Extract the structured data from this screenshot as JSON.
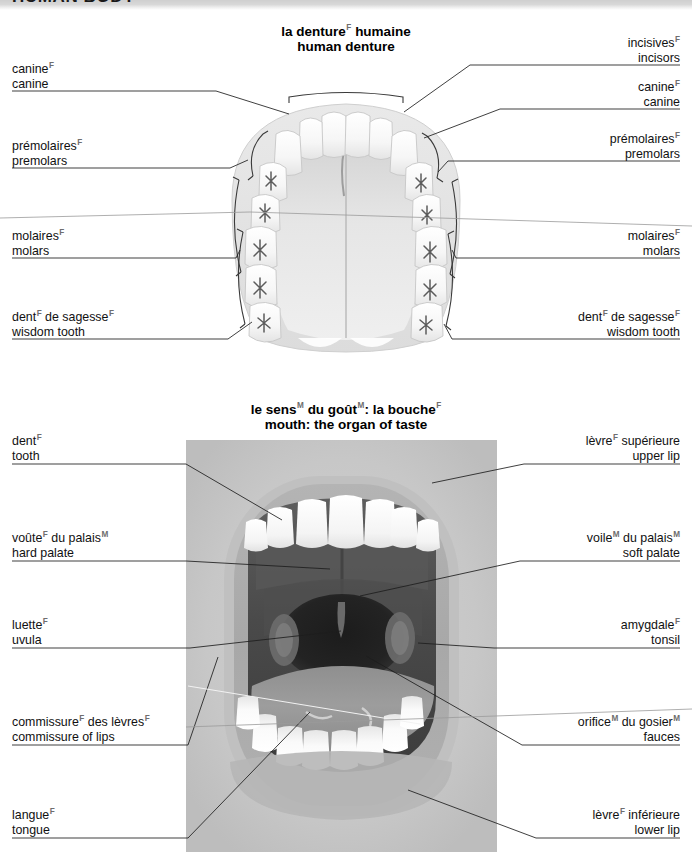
{
  "header": {
    "title": "HUMAN BODY"
  },
  "sections": [
    {
      "id": "denture",
      "title_fr": "la denture",
      "title_fr_sup": "F",
      "title_fr_tail": " humaine",
      "title_en": "human denture",
      "labels_left": [
        {
          "fr": "canine",
          "fr_sup": "F",
          "en": "canine"
        },
        {
          "fr": "prémolaires",
          "fr_sup": "F",
          "en": "premolars"
        },
        {
          "fr": "molaires",
          "fr_sup": "F",
          "en": "molars"
        },
        {
          "fr": "dent",
          "fr_sup": "F",
          "fr_tail": " de sagesse",
          "fr_sup2": "F",
          "en": "wisdom tooth"
        }
      ],
      "labels_right": [
        {
          "fr": "incisives",
          "fr_sup": "F",
          "en": "incisors"
        },
        {
          "fr": "canine",
          "fr_sup": "F",
          "en": "canine"
        },
        {
          "fr": "prémolaires",
          "fr_sup": "F",
          "en": "premolars"
        },
        {
          "fr": "molaires",
          "fr_sup": "F",
          "en": "molars"
        },
        {
          "fr": "dent",
          "fr_sup": "F",
          "fr_tail": " de sagesse",
          "fr_sup2": "F",
          "en": "wisdom tooth"
        }
      ]
    },
    {
      "id": "mouth",
      "title_fr": "le sens",
      "title_fr_sup": "M",
      "title_fr_mid": " du goût",
      "title_fr_sup2": "M",
      "title_fr_tail2": ": la bouche",
      "title_fr_sup3": "F",
      "title_en": "mouth: the organ of taste",
      "labels_left": [
        {
          "fr": "dent",
          "fr_sup": "F",
          "en": "tooth"
        },
        {
          "fr": "voûte",
          "fr_sup": "F",
          "fr_tail": " du palais",
          "fr_sup2": "M",
          "en": "hard palate"
        },
        {
          "fr": "luette",
          "fr_sup": "F",
          "en": "uvula"
        },
        {
          "fr": "commissure",
          "fr_sup": "F",
          "fr_tail": " des lèvres",
          "fr_sup2": "F",
          "en": "commissure of lips"
        },
        {
          "fr": "langue",
          "fr_sup": "F",
          "en": "tongue"
        }
      ],
      "labels_right": [
        {
          "fr": "lèvre",
          "fr_sup": "F",
          "fr_tail": " supérieure",
          "en": "upper lip"
        },
        {
          "fr": "voile",
          "fr_sup": "M",
          "fr_tail": " du palais",
          "fr_sup2": "M",
          "en": "soft palate"
        },
        {
          "fr": "amygdale",
          "fr_sup": "F",
          "en": "tonsil"
        },
        {
          "fr": "orifice",
          "fr_sup": "M",
          "fr_tail": " du gosier",
          "fr_sup2": "M",
          "en": "fauces"
        },
        {
          "fr": "lèvre",
          "fr_sup": "F",
          "fr_tail": " inférieure",
          "en": "lower lip"
        }
      ]
    }
  ],
  "colors": {
    "text": "#111111",
    "gender_marker": "#6e6e6e",
    "leader": "#1d1d1d",
    "photo_bg": "#c8c8c8",
    "header_band": "#d4d4d4"
  }
}
